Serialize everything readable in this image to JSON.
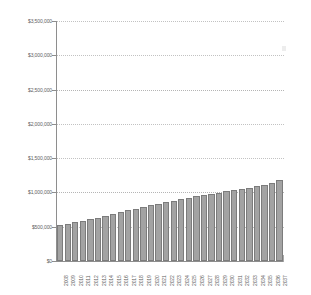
{
  "chart_data": {
    "type": "bar",
    "title": "",
    "subtitle": "",
    "xlabel": "",
    "ylabel": "",
    "legend": [],
    "grid": true,
    "legend_position": "none",
    "ylim": [
      0,
      3500000
    ],
    "y_ticks": [
      0,
      500000,
      1000000,
      1500000,
      2000000,
      2500000,
      3000000,
      3500000
    ],
    "y_tick_labels": [
      "$0",
      "$500,000",
      "$1,000,000",
      "$1,500,000",
      "$2,000,000",
      "$2,500,000",
      "$3,000,000",
      "$3,500,000"
    ],
    "categories": [
      "2008",
      "2009",
      "2010",
      "2011",
      "2012",
      "2013",
      "2014",
      "2015",
      "2016",
      "2017",
      "2018",
      "2019",
      "2020",
      "2021",
      "2022",
      "2023",
      "2024",
      "2025",
      "2026",
      "2027",
      "2028",
      "2029",
      "2030",
      "2031",
      "2032",
      "2033",
      "2034",
      "2035",
      "2036",
      "2037"
    ],
    "values": [
      520000,
      540000,
      562000,
      585000,
      608000,
      632000,
      657000,
      683000,
      710000,
      738000,
      762000,
      787000,
      812000,
      838000,
      860000,
      882000,
      905000,
      925000,
      945000,
      962000,
      980000,
      998000,
      1016000,
      1034000,
      1052000,
      1070000,
      1090000,
      1110000,
      1140000,
      1180000
    ],
    "colors": {
      "bar_fill": "#a3a3a3",
      "bar_border": "#7c7c7c",
      "gridline": "#c2c2c2",
      "axis": "#8e8e8e",
      "tick_text": "#5d5d5d",
      "background": "#ffffff"
    }
  }
}
